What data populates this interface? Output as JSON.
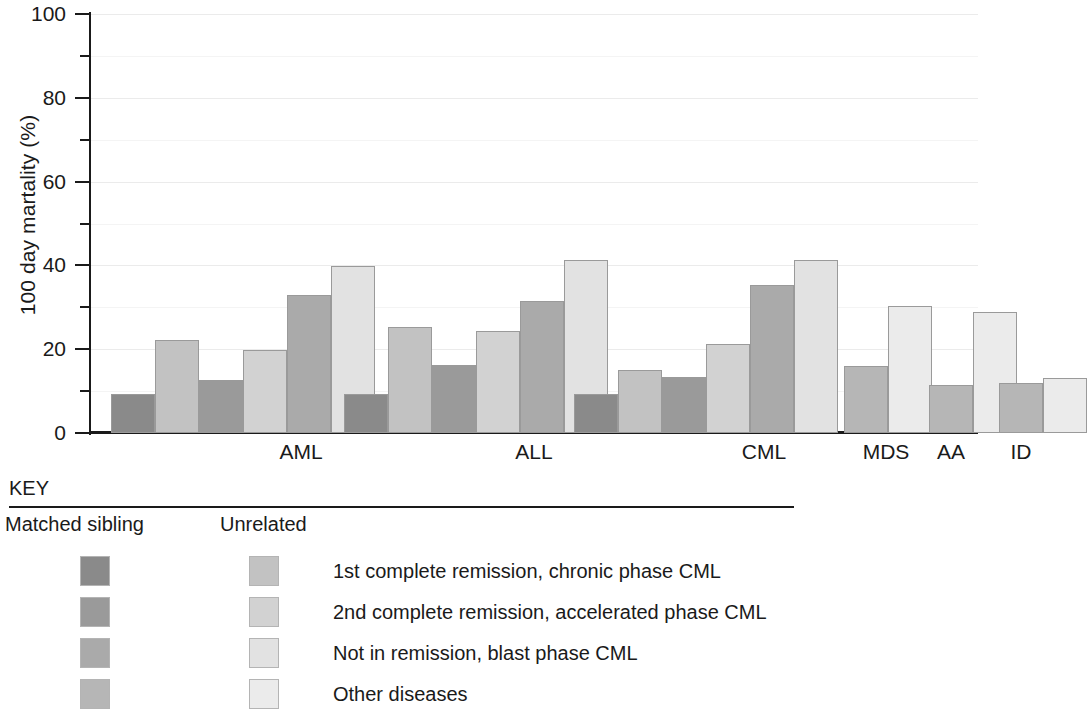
{
  "chart_data": {
    "type": "bar",
    "title": "",
    "subtitle": "",
    "xlabel": "",
    "ylabel": "100 day martality (%)",
    "ylim": [
      0,
      100
    ],
    "ytick_labels": [
      "0",
      "20",
      "40",
      "60",
      "80",
      "100"
    ],
    "ytick_values": [
      0,
      20,
      40,
      60,
      80,
      100
    ],
    "yminor_values": [
      10,
      30,
      50,
      70,
      90
    ],
    "grid": "horizontal",
    "legend_position": "below",
    "categories": [
      "AML",
      "ALL",
      "CML",
      "MDS",
      "AA",
      "ID"
    ],
    "series": [
      {
        "name": "Matched sibling, 1st complete remission, chronic phase CML",
        "donor": "Matched sibling",
        "status": "1st complete remission, chronic phase CML",
        "color": "#8a8a8a",
        "values": [
          9.3,
          9.3,
          9.2,
          null,
          null,
          null
        ]
      },
      {
        "name": "Unrelated, 1st complete remission, chronic phase CML",
        "donor": "Unrelated",
        "status": "1st complete remission, chronic phase CML",
        "color": "#c2c2c2",
        "values": [
          22.2,
          25.2,
          15.0,
          null,
          null,
          null
        ]
      },
      {
        "name": "Matched sibling, 2nd complete remission, accelerated phase CML",
        "donor": "Matched sibling",
        "status": "2nd complete remission, accelerated phase CML",
        "color": "#9a9a9a",
        "values": [
          12.6,
          16.2,
          13.4,
          null,
          null,
          null
        ]
      },
      {
        "name": "Unrelated, 2nd complete remission, accelerated phase CML",
        "donor": "Unrelated",
        "status": "2nd complete remission, accelerated phase CML",
        "color": "#d2d2d2",
        "values": [
          19.8,
          24.3,
          21.2,
          null,
          null,
          null
        ]
      },
      {
        "name": "Matched sibling, Not in remission, blast phase CML",
        "donor": "Matched sibling",
        "status": "Not in remission, blast phase CML",
        "color": "#aaaaaa",
        "values": [
          33.0,
          31.4,
          35.4,
          null,
          null,
          null
        ]
      },
      {
        "name": "Unrelated, Not in remission, blast phase CML",
        "donor": "Unrelated",
        "status": "Not in remission, blast phase CML",
        "color": "#e2e2e2",
        "values": [
          39.9,
          41.2,
          41.3,
          null,
          null,
          null
        ]
      },
      {
        "name": "Matched sibling, Other diseases",
        "donor": "Matched sibling",
        "status": "Other diseases",
        "color": "#b6b6b6",
        "values": [
          null,
          null,
          null,
          16.0,
          11.5,
          12.0
        ]
      },
      {
        "name": "Unrelated, Other diseases",
        "donor": "Unrelated",
        "status": "Other diseases",
        "color": "#ebebeb",
        "values": [
          null,
          null,
          null,
          30.2,
          28.9,
          13.1
        ]
      }
    ]
  },
  "key": {
    "title": "KEY",
    "col_matched": "Matched sibling",
    "col_unrelated": "Unrelated",
    "rows": [
      {
        "label": "1st complete remission, chronic phase CML",
        "sibling_color": "#8a8a8a",
        "unrelated_color": "#c2c2c2"
      },
      {
        "label": "2nd complete remission, accelerated phase CML",
        "sibling_color": "#9a9a9a",
        "unrelated_color": "#d2d2d2"
      },
      {
        "label": "Not in remission, blast phase CML",
        "sibling_color": "#aaaaaa",
        "unrelated_color": "#e2e2e2"
      },
      {
        "label": "Other diseases",
        "sibling_color": "#b6b6b6",
        "unrelated_color": "#ebebeb"
      }
    ]
  }
}
